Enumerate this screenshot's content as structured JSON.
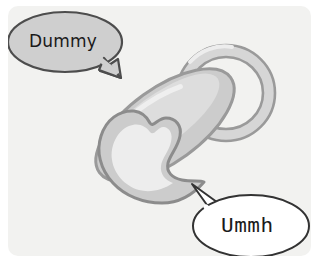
{
  "scene": {
    "title": "Dummy (baby pacifier) cartoon illustration",
    "background_color": "#ffffff",
    "card_color": "#f2f2f0"
  },
  "speech_bubbles": [
    {
      "id": "dummy",
      "text": "Dummy",
      "fill_color": "#cfcfcf",
      "stroke_color": "#4d4d4d",
      "text_color": "#1a1a1a",
      "tail_direction": "down-right",
      "position": "top-left"
    },
    {
      "id": "ummh",
      "text": "Ummh",
      "fill_color": "#ffffff",
      "stroke_color": "#333333",
      "text_color": "#1a1a1a",
      "tail_direction": "up-left",
      "position": "bottom-right"
    }
  ],
  "pacifier": {
    "label": "pacifier",
    "parts": [
      {
        "name": "ring-handle",
        "fill_color": "#d4d4d4",
        "stroke_color": "#9a9a9a"
      },
      {
        "name": "shield",
        "fill_color": "#cccccc",
        "stroke_color": "#9a9a9a"
      },
      {
        "name": "shield-highlight",
        "fill_color": "#e2e2e2"
      },
      {
        "name": "teat",
        "fill_color": "#cccccc",
        "stroke_color": "#8c8c8c"
      },
      {
        "name": "teat-highlight",
        "fill_color": "#ededed"
      }
    ]
  }
}
